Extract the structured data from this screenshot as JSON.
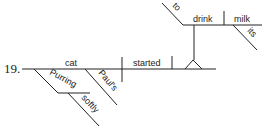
{
  "diagram": {
    "type": "reed-kellogg-sentence-diagram",
    "number": "19.",
    "words": {
      "subject": "cat",
      "verb": "started",
      "infinitive_marker": "to",
      "infinitive_verb": "drink",
      "infinitive_object": "milk",
      "object_modifier": "its",
      "possessive_modifier": "Paul's",
      "participle": "Purring",
      "adverb": "softly"
    }
  }
}
